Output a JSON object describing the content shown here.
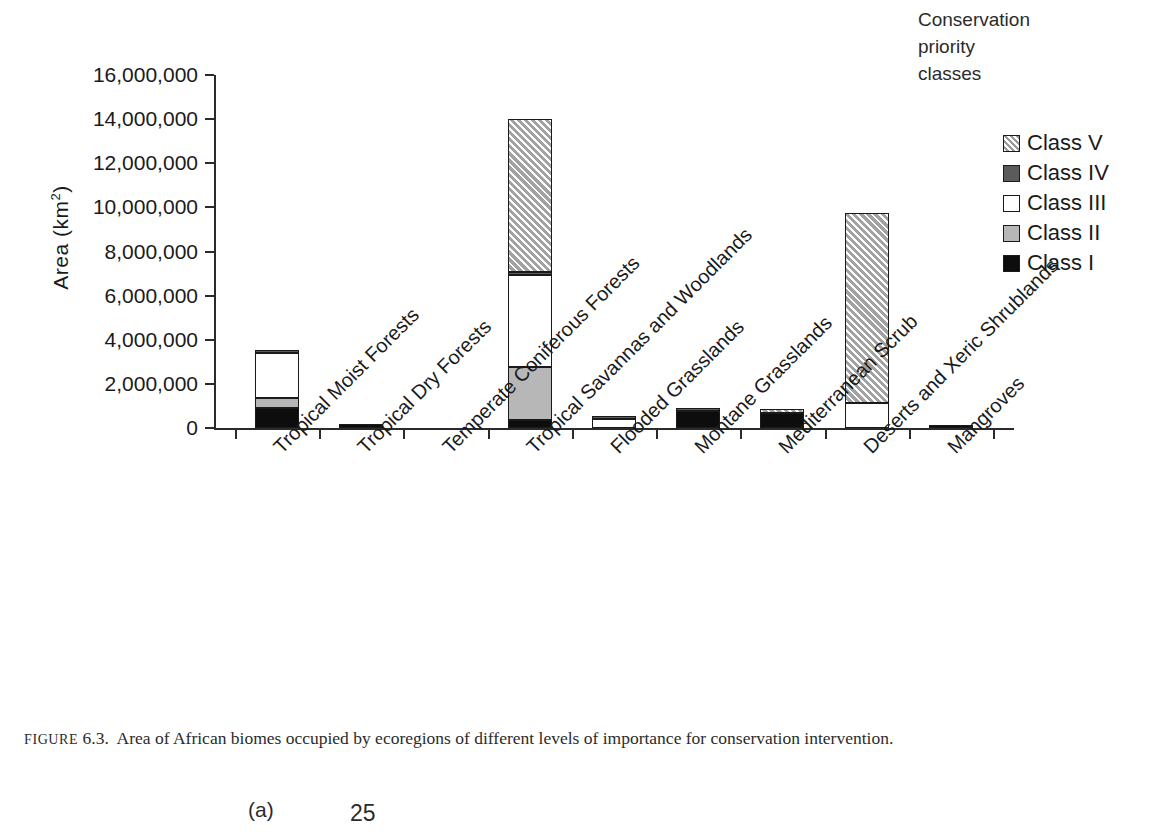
{
  "figure": {
    "caption_prefix": "FIGURE",
    "caption_number": "6.3.",
    "caption_text": "Area of African biomes occupied by ecoregions of different levels of importance for conservation intervention."
  },
  "legend": {
    "title_lines": [
      "Conservation",
      "priority",
      "classes"
    ],
    "items": [
      {
        "label": "Class V",
        "swatch": "hatched-gray-swatch",
        "color": "#a2a2a2"
      },
      {
        "label": "Class IV",
        "swatch": "dark-gray-swatch",
        "color": "#5b5b5b"
      },
      {
        "label": "Class III",
        "swatch": "white-swatch",
        "color": "#ffffff"
      },
      {
        "label": "Class II",
        "swatch": "light-gray-swatch",
        "color": "#b7b7b7"
      },
      {
        "label": "Class I",
        "swatch": "black-swatch",
        "color": "#0d0d0d"
      }
    ]
  },
  "axes": {
    "ylabel_text": "Area (km",
    "ylabel_sup": "2",
    "ylabel_close": ")",
    "ytick_labels": [
      "16,000,000",
      "14,000,000",
      "12,000,000",
      "10,000,000",
      "8,000,000",
      "6,000,000",
      "4,000,000",
      "2,000,000",
      "0"
    ]
  },
  "bottom_fragment": {
    "panel_label": "(a)",
    "number": "25"
  },
  "chart_data": {
    "type": "bar",
    "subtype": "stacked-vertical",
    "title": "",
    "xlabel": "",
    "ylabel": "Area (km2)",
    "ylim": [
      0,
      16000000
    ],
    "ytick_values": [
      0,
      2000000,
      4000000,
      6000000,
      8000000,
      10000000,
      12000000,
      14000000,
      16000000
    ],
    "grid": false,
    "legend_position": "right",
    "categories": [
      "Tropical Moist Forests",
      "Tropical Dry Forests",
      "Temperate Coniferous Forests",
      "Tropical Savannas and Woodlands",
      "Flooded Grasslands",
      "Montane Grasslands",
      "Mediterranean Scrub",
      "Deserts and Xeric Shrublands",
      "Mangroves"
    ],
    "series": [
      {
        "name": "Class I",
        "values": [
          900000,
          170000,
          0,
          350000,
          0,
          760000,
          700000,
          0,
          80000
        ]
      },
      {
        "name": "Class II",
        "values": [
          450000,
          0,
          0,
          2400000,
          0,
          0,
          0,
          0,
          0
        ]
      },
      {
        "name": "Class III",
        "values": [
          2050000,
          0,
          0,
          4200000,
          400000,
          0,
          0,
          1150000,
          0
        ]
      },
      {
        "name": "Class IV",
        "values": [
          150000,
          0,
          0,
          130000,
          80000,
          100000,
          0,
          0,
          0
        ]
      },
      {
        "name": "Class V",
        "values": [
          0,
          0,
          0,
          6920000,
          0,
          0,
          170000,
          8600000,
          0
        ]
      }
    ],
    "totals": [
      3550000,
      170000,
      0,
      14000000,
      480000,
      860000,
      870000,
      9750000,
      80000
    ]
  }
}
